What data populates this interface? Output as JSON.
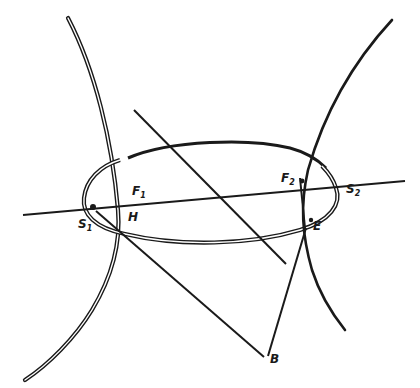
{
  "figure": {
    "type": "geometric construction",
    "ink_color": "#1a1a1a",
    "background": "#ffffff"
  },
  "labels": {
    "S1": {
      "main": "S",
      "sub": "1"
    },
    "F1": {
      "main": "F",
      "sub": "1"
    },
    "H": {
      "main": "H"
    },
    "F2": {
      "main": "F",
      "sub": "2"
    },
    "S2": {
      "main": "S",
      "sub": "2"
    },
    "E": {
      "main": "E"
    },
    "B": {
      "main": "B"
    }
  }
}
